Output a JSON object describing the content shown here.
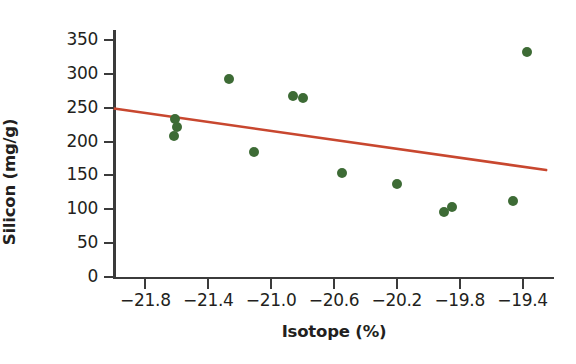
{
  "chart_data": {
    "type": "scatter",
    "title": "",
    "xlabel": "Isotope (%)",
    "ylabel": "Silicon (mg/g)",
    "xlim": [
      -22.0,
      -19.2
    ],
    "ylim": [
      0,
      365
    ],
    "xticks": [
      -21.8,
      -21.4,
      -21.0,
      -20.6,
      -20.2,
      -19.8,
      -19.4
    ],
    "xtick_labels": [
      "−21.8",
      "−21.4",
      "−21.0",
      "−20.6",
      "−20.2",
      "−19.8",
      "−19.4"
    ],
    "yticks": [
      0,
      50,
      100,
      150,
      200,
      250,
      300,
      350
    ],
    "ytick_labels": [
      "0",
      "50",
      "100",
      "150",
      "200",
      "250",
      "300",
      "350"
    ],
    "grid": false,
    "legend": null,
    "marker_color": "#3d6b35",
    "line_color": "#c8472f",
    "axis_color": "#3b3b3b",
    "points": [
      {
        "x": -21.61,
        "y": 233
      },
      {
        "x": -21.6,
        "y": 222
      },
      {
        "x": -21.62,
        "y": 209
      },
      {
        "x": -21.27,
        "y": 292
      },
      {
        "x": -21.11,
        "y": 184
      },
      {
        "x": -20.86,
        "y": 268
      },
      {
        "x": -20.8,
        "y": 265
      },
      {
        "x": -20.55,
        "y": 153
      },
      {
        "x": -20.2,
        "y": 138
      },
      {
        "x": -19.9,
        "y": 96
      },
      {
        "x": -19.85,
        "y": 104
      },
      {
        "x": -19.46,
        "y": 113
      },
      {
        "x": -19.37,
        "y": 332
      }
    ],
    "trendline": {
      "x_start": -22.0,
      "y_start": 249,
      "x_end": -19.25,
      "y_end": 158,
      "slope": -33.1,
      "description": "negative linear fit"
    }
  }
}
